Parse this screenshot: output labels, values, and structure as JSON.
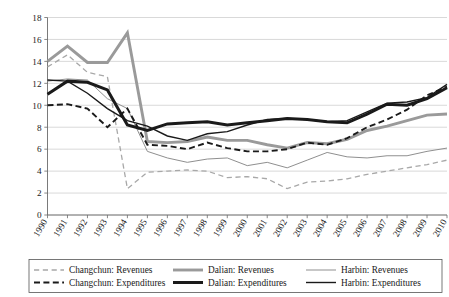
{
  "chart_data": {
    "type": "line",
    "title": "",
    "subtitle": "",
    "xlabel": "",
    "ylabel": "",
    "x": [
      1990,
      1991,
      1992,
      1993,
      1994,
      1995,
      1996,
      1997,
      1998,
      1999,
      2000,
      2001,
      2002,
      2003,
      2004,
      2005,
      2006,
      2007,
      2008,
      2009,
      2010
    ],
    "xtick_labels": [
      "1990",
      "1991",
      "1992",
      "1993",
      "1994",
      "1995",
      "1996",
      "1997",
      "1998",
      "1999",
      "2000",
      "2001",
      "2002",
      "2003",
      "2004",
      "2005",
      "2006",
      "2007",
      "2008",
      "2009",
      "2010"
    ],
    "ylim": [
      0,
      18
    ],
    "ytick_labels": [
      "0",
      "2",
      "4",
      "6",
      "8",
      "10",
      "12",
      "14",
      "16",
      "18"
    ],
    "ytick_values": [
      0,
      2,
      4,
      6,
      8,
      10,
      12,
      14,
      16,
      18
    ],
    "grid": true,
    "legend_position": "bottom",
    "series": [
      {
        "name": "Changchun: Revenues",
        "legend_label": "Changchun: Revenues",
        "color": "#a8a8a8",
        "style": "dashed",
        "width": 1.3,
        "values": [
          13.5,
          14.6,
          13.0,
          12.6,
          2.4,
          3.9,
          4.0,
          4.1,
          4.0,
          3.4,
          3.5,
          3.3,
          2.4,
          3.0,
          3.1,
          3.3,
          3.7,
          4.0,
          4.3,
          4.6,
          5.0
        ]
      },
      {
        "name": "Changchun: Expenditures",
        "legend_label": "Changchun: Expenditures",
        "color": "#1a1a1a",
        "style": "dashed",
        "width": 1.9,
        "values": [
          10.0,
          10.1,
          9.7,
          8.0,
          9.7,
          6.4,
          6.3,
          6.0,
          6.6,
          6.1,
          5.8,
          5.8,
          6.0,
          6.6,
          6.4,
          7.0,
          8.0,
          8.7,
          9.6,
          10.9,
          11.7
        ]
      },
      {
        "name": "Dalian: Revenues",
        "legend_label": "Dalian: Revenues",
        "color": "#9a9a9a",
        "style": "solid",
        "width": 2.9,
        "values": [
          14.0,
          15.4,
          13.9,
          13.9,
          16.6,
          6.7,
          6.6,
          6.7,
          7.1,
          6.8,
          6.8,
          6.4,
          6.1,
          6.6,
          6.5,
          6.9,
          7.7,
          8.1,
          8.6,
          9.1,
          9.2
        ]
      },
      {
        "name": "Dalian: Expenditures",
        "legend_label": "Dalian: Expenditures",
        "color": "#1a1a1a",
        "style": "solid",
        "width": 3.0,
        "values": [
          11.0,
          12.2,
          12.1,
          11.4,
          8.2,
          7.7,
          8.3,
          8.4,
          8.5,
          8.2,
          8.4,
          8.6,
          8.8,
          8.7,
          8.5,
          8.4,
          9.2,
          10.1,
          10.0,
          10.6,
          11.6
        ]
      },
      {
        "name": "Harbin: Revenues",
        "legend_label": "Harbin: Revenues",
        "color": "#8f8f8f",
        "style": "solid",
        "width": 1.0,
        "values": [
          12.2,
          12.4,
          12.3,
          10.6,
          9.7,
          5.8,
          5.2,
          4.8,
          5.1,
          5.2,
          4.5,
          4.8,
          4.3,
          5.0,
          5.7,
          5.3,
          5.2,
          5.4,
          5.4,
          5.8,
          6.1
        ]
      },
      {
        "name": "Harbin: Expenditures",
        "legend_label": "Harbin: Expenditures",
        "color": "#1a1a1a",
        "style": "solid",
        "width": 1.4,
        "values": [
          12.3,
          12.2,
          11.1,
          9.7,
          8.6,
          8.1,
          7.2,
          6.8,
          7.4,
          7.6,
          8.2,
          8.7,
          8.8,
          8.7,
          8.5,
          8.6,
          9.4,
          10.2,
          10.3,
          10.7,
          11.9
        ]
      }
    ]
  },
  "legend": {
    "columns": [
      [
        "Changchun: Revenues",
        "Changchun: Expenditures"
      ],
      [
        "Dalian: Revenues",
        "Dalian: Expenditures"
      ],
      [
        "Harbin: Revenues",
        "Harbin: Expenditures"
      ]
    ]
  }
}
